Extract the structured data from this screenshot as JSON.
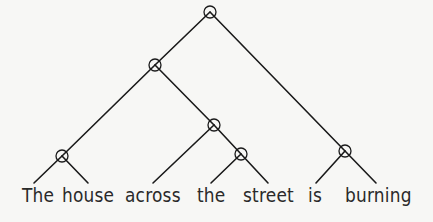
{
  "diagram": {
    "type": "binary-parse-tree",
    "sentence": "The house across the street is burning",
    "words": [
      {
        "text": "The",
        "x": 22,
        "leaf_x": 34
      },
      {
        "text": "house",
        "x": 62,
        "leaf_x": 88
      },
      {
        "text": "across",
        "x": 125,
        "leaf_x": 153
      },
      {
        "text": "the",
        "x": 197,
        "leaf_x": 211
      },
      {
        "text": "street",
        "x": 243,
        "leaf_x": 268
      },
      {
        "text": "is",
        "x": 308,
        "leaf_x": 316
      },
      {
        "text": "burning",
        "x": 345,
        "leaf_x": 376
      }
    ],
    "leaf_y": 183,
    "nodes": [
      {
        "id": "root",
        "x": 210,
        "y": 12
      },
      {
        "id": "np",
        "x": 155,
        "y": 65
      },
      {
        "id": "the-house",
        "x": 62,
        "y": 156
      },
      {
        "id": "across-the-street",
        "x": 214,
        "y": 125
      },
      {
        "id": "the-street",
        "x": 241,
        "y": 154
      },
      {
        "id": "is-burning",
        "x": 345,
        "y": 151
      }
    ],
    "edges": [
      [
        "root",
        "np"
      ],
      [
        "root",
        "is-burning"
      ],
      [
        "np",
        "the-house"
      ],
      [
        "np",
        "across-the-street"
      ],
      [
        "the-house",
        "w0"
      ],
      [
        "the-house",
        "w1"
      ],
      [
        "across-the-street",
        "w2"
      ],
      [
        "across-the-street",
        "the-street"
      ],
      [
        "the-street",
        "w3"
      ],
      [
        "the-street",
        "w4"
      ],
      [
        "is-burning",
        "w5"
      ],
      [
        "is-burning",
        "w6"
      ]
    ],
    "node_radius": 6,
    "line_color": "#1a1a1a",
    "background": "#f7f7f5"
  }
}
